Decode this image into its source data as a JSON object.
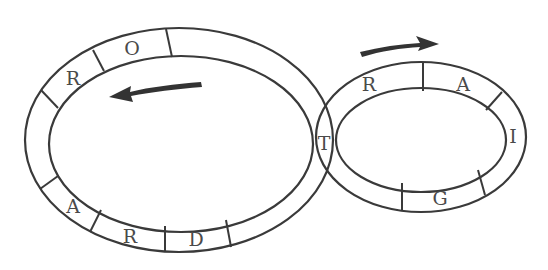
{
  "diagram": {
    "large_track": {
      "direction": "counterclockwise",
      "letters": [
        {
          "id": "r1",
          "text": "R"
        },
        {
          "id": "o",
          "text": "O"
        },
        {
          "id": "a1",
          "text": "A"
        },
        {
          "id": "r2",
          "text": "R"
        },
        {
          "id": "d",
          "text": "D"
        }
      ]
    },
    "shared_cell": {
      "text": "T"
    },
    "small_track": {
      "direction": "clockwise",
      "letters": [
        {
          "id": "r3",
          "text": "R"
        },
        {
          "id": "a2",
          "text": "A"
        },
        {
          "id": "i",
          "text": "I"
        },
        {
          "id": "g",
          "text": "G"
        }
      ]
    },
    "colors": {
      "stroke": "#3a3a3a",
      "letter": "#4a4a4a",
      "arrow": "#333333",
      "background": "#ffffff"
    }
  }
}
